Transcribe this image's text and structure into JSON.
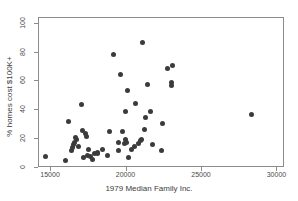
{
  "chart_data": {
    "type": "scatter",
    "title": "",
    "xlabel": "1979 Median Family Inc.",
    "ylabel": "% homes cost $100K+",
    "xlim": [
      14200,
      30500
    ],
    "ylim": [
      0,
      104
    ],
    "xticks": [
      15000,
      20000,
      25000,
      30000
    ],
    "xtick_labels": [
      "15000",
      "20000",
      "25000",
      "30000"
    ],
    "yticks": [
      0,
      20,
      40,
      60,
      80,
      100
    ],
    "ytick_labels": [
      "0",
      "20",
      "40",
      "60",
      "80",
      "100"
    ],
    "grid": false,
    "legend": false,
    "marker": "filled-circle",
    "marker_color": "#3b3b3b",
    "points": [
      {
        "x": 14650,
        "y": 8
      },
      {
        "x": 15950,
        "y": 5
      },
      {
        "x": 16150,
        "y": 32
      },
      {
        "x": 16350,
        "y": 12
      },
      {
        "x": 16420,
        "y": 14
      },
      {
        "x": 16480,
        "y": 16
      },
      {
        "x": 16550,
        "y": 18
      },
      {
        "x": 16600,
        "y": 21
      },
      {
        "x": 16700,
        "y": 20
      },
      {
        "x": 16800,
        "y": 15
      },
      {
        "x": 17000,
        "y": 44
      },
      {
        "x": 17050,
        "y": 26
      },
      {
        "x": 17150,
        "y": 7
      },
      {
        "x": 17300,
        "y": 24
      },
      {
        "x": 17350,
        "y": 22
      },
      {
        "x": 17400,
        "y": 9
      },
      {
        "x": 17450,
        "y": 13
      },
      {
        "x": 17600,
        "y": 8
      },
      {
        "x": 17750,
        "y": 6
      },
      {
        "x": 17900,
        "y": 10
      },
      {
        "x": 18050,
        "y": 11
      },
      {
        "x": 18100,
        "y": 10
      },
      {
        "x": 18400,
        "y": 13
      },
      {
        "x": 18750,
        "y": 9
      },
      {
        "x": 18900,
        "y": 25
      },
      {
        "x": 19150,
        "y": 79
      },
      {
        "x": 19450,
        "y": 12
      },
      {
        "x": 19500,
        "y": 18
      },
      {
        "x": 19600,
        "y": 65
      },
      {
        "x": 19700,
        "y": 25
      },
      {
        "x": 19850,
        "y": 17
      },
      {
        "x": 19900,
        "y": 20
      },
      {
        "x": 19950,
        "y": 39
      },
      {
        "x": 20000,
        "y": 18
      },
      {
        "x": 20050,
        "y": 54
      },
      {
        "x": 20100,
        "y": 7
      },
      {
        "x": 20300,
        "y": 13
      },
      {
        "x": 20500,
        "y": 15
      },
      {
        "x": 20600,
        "y": 45
      },
      {
        "x": 20800,
        "y": 17
      },
      {
        "x": 20950,
        "y": 19
      },
      {
        "x": 21000,
        "y": 20
      },
      {
        "x": 21050,
        "y": 87
      },
      {
        "x": 21200,
        "y": 27
      },
      {
        "x": 21250,
        "y": 35
      },
      {
        "x": 21400,
        "y": 58
      },
      {
        "x": 21600,
        "y": 39
      },
      {
        "x": 21750,
        "y": 16
      },
      {
        "x": 22300,
        "y": 12
      },
      {
        "x": 22400,
        "y": 31
      },
      {
        "x": 22700,
        "y": 69
      },
      {
        "x": 22950,
        "y": 59
      },
      {
        "x": 22980,
        "y": 57
      },
      {
        "x": 23050,
        "y": 71
      },
      {
        "x": 28300,
        "y": 37
      }
    ]
  }
}
